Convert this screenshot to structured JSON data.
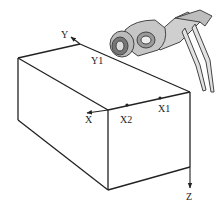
{
  "diagram": {
    "title": "",
    "type": "workpiece coordinate diagram",
    "labels": {
      "y_axis": "Y",
      "y1_point": "Y1",
      "x_axis": "X",
      "x2_point": "X2",
      "x1_point": "X1",
      "z_axis": "Z"
    },
    "elements": [
      {
        "id": "box",
        "description": "Rectangular block (cuboid) drawn in perspective"
      },
      {
        "id": "robot",
        "description": "Robot arm end-effector / gripper touching the top corner of the block"
      },
      {
        "id": "x-axis",
        "description": "Arrow along front top edge pointing left, with points X2 and X1 marked"
      },
      {
        "id": "y-axis",
        "description": "Arrow along back top edge pointing up-left, with label Y1"
      },
      {
        "id": "z-axis",
        "description": "Arrow pointing down from bottom-right corner"
      }
    ],
    "colors": {
      "line": "#222222",
      "background": "#ffffff",
      "robot_shade": "#9a9a9a"
    }
  }
}
